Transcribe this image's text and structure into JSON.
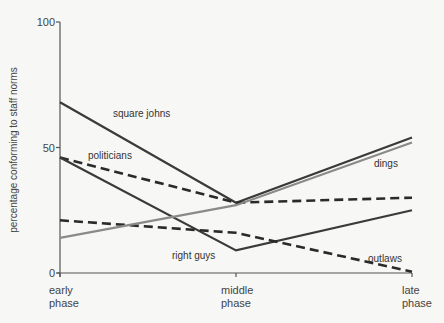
{
  "chart_data": {
    "type": "line",
    "title": "",
    "xlabel": "",
    "ylabel": "percentage conforming to staff norms",
    "ylim": [
      0,
      100
    ],
    "yticks": [
      "0",
      "50",
      "100"
    ],
    "categories": [
      {
        "line1": "early",
        "line2": "phase"
      },
      {
        "line1": "middle",
        "line2": "phase"
      },
      {
        "line1": "late",
        "line2": "phase"
      }
    ],
    "grid": false,
    "series": [
      {
        "name": "square johns",
        "style": "solid",
        "color": "#3a3a3a",
        "values": [
          68,
          28,
          54
        ]
      },
      {
        "name": "politicians",
        "style": "dashed",
        "color": "#2a2a2a",
        "values": [
          46,
          28,
          30
        ]
      },
      {
        "name": "right guys",
        "style": "solid",
        "color": "#3a3a3a",
        "values": [
          46,
          9,
          25
        ]
      },
      {
        "name": "outlaws",
        "style": "dashed",
        "color": "#2a2a2a",
        "values": [
          21,
          16,
          0.5
        ]
      },
      {
        "name": "dings",
        "style": "solid",
        "color": "#8a8a8a",
        "values": [
          14,
          27,
          52
        ]
      }
    ]
  }
}
